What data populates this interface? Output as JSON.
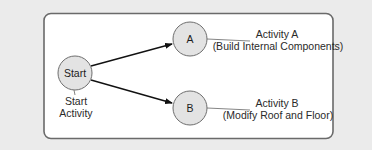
{
  "diagram": {
    "nodes": {
      "start": {
        "label": "Start",
        "caption_line1": "Start",
        "caption_line2": "Activity"
      },
      "a": {
        "label": "A",
        "caption_line1": "Activity A",
        "caption_line2": "(Build Internal Components)"
      },
      "b": {
        "label": "B",
        "caption_line1": "Activity B",
        "caption_line2": "(Modify Roof and Floor)"
      }
    },
    "edges": [
      {
        "from": "Start",
        "to": "A"
      },
      {
        "from": "Start",
        "to": "B"
      }
    ],
    "colors": {
      "background": "#ebebeb",
      "panel": "#ffffff",
      "panel_border": "#6a6a6a",
      "node_fill": "#e3e3e3",
      "node_border": "#6e6e6e",
      "arrow": "#111111"
    }
  }
}
